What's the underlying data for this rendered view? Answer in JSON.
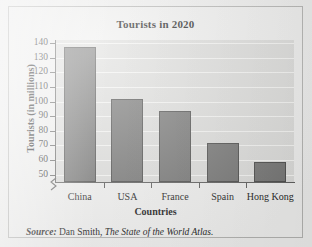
{
  "chart_data": {
    "type": "bar",
    "title": "Tourists in 2020",
    "xlabel": "Countries",
    "ylabel": "Tourists (in millions)",
    "categories": [
      "China",
      "USA",
      "France",
      "Spain",
      "Hong Kong"
    ],
    "values": [
      137,
      102,
      93.5,
      71.5,
      58.5
    ],
    "ylim": [
      45,
      142
    ],
    "yticks": [
      140,
      130,
      120,
      110,
      100,
      90,
      80,
      70,
      60,
      50
    ],
    "ytick_labels": [
      "140",
      "130",
      "120",
      "110",
      "100",
      "90",
      "80",
      "70",
      "60",
      "50"
    ],
    "axis_break": true,
    "grid": "horizontal",
    "legend": "none",
    "bar_color": "#747473",
    "bar_edge_color": "#4b4b4a",
    "plot_background": "#dcdcda",
    "figure_background": "#efefee"
  },
  "source": {
    "label": "Source:",
    "author": "Dan Smith,",
    "work": "The State of the World Atlas."
  }
}
